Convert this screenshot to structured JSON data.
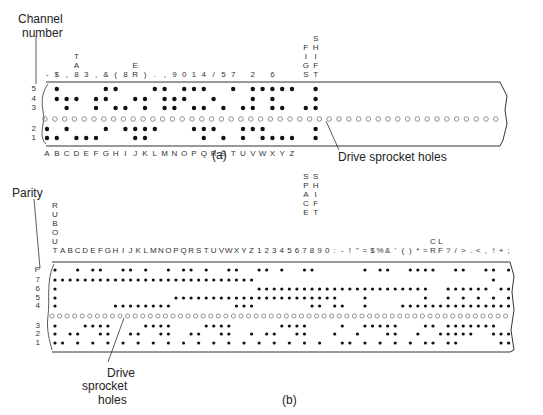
{
  "figure_a": {
    "caption": "(a)",
    "axis_label_line1": "Channel",
    "axis_label_line2": "number",
    "channels": [
      "5",
      "4",
      "3",
      "2",
      "1"
    ],
    "bottom_labels": [
      "A",
      "B",
      "C",
      "D",
      "E",
      "F",
      "G",
      "H",
      "I",
      "J",
      "K",
      "L",
      "M",
      "N",
      "O",
      "P",
      "Q",
      "R",
      "S",
      "T",
      "U",
      "V",
      "W",
      "X",
      "Y",
      "Z",
      "SPACE",
      "SHIFT"
    ],
    "top_labels": [
      "-",
      "$",
      ",",
      "8",
      "3",
      ",",
      "&",
      "(",
      "8",
      "ER",
      ")",
      ".",
      ",",
      "9",
      "0",
      "1",
      "4",
      "/",
      "5",
      "7",
      "",
      "2",
      "",
      "6",
      "",
      "",
      "FIGS",
      "SHIFT"
    ],
    "top_extra_stacked": {
      "TAB": "TAB",
      "ER": "ER"
    },
    "sprocket_label": "Drive sprocket holes",
    "codes": [
      "11000",
      "10011",
      "01110",
      "10010",
      "10000",
      "10110",
      "01011",
      "00101",
      "01100",
      "11010",
      "11110",
      "01001",
      "00111",
      "00110",
      "00011",
      "01101",
      "11101",
      "01010",
      "10100",
      "00001",
      "11100",
      "01111",
      "11001",
      "10111",
      "10101",
      "10001",
      "00100",
      "11111"
    ]
  },
  "figure_b": {
    "caption": "(b)",
    "axis_label": "Parity",
    "channels": [
      "P",
      "7",
      "6",
      "5",
      "4",
      "3",
      "2",
      "1"
    ],
    "rubout_label": "RUBOUT",
    "top_labels": [
      "T",
      "A",
      "B",
      "C",
      "D",
      "E",
      "F",
      "G",
      "H",
      "I",
      "J",
      "K",
      "L",
      "M",
      "N",
      "O",
      "P",
      "Q",
      "R",
      "S",
      "T",
      "U",
      "V",
      "W",
      "X",
      "Y",
      "Z",
      "1",
      "2",
      "3",
      "4",
      "5",
      "6",
      "7",
      "8",
      "9",
      "0",
      ":",
      "-",
      "!",
      "\"",
      "=",
      "$",
      "%",
      "&",
      "'",
      "(",
      ")",
      "*",
      "=",
      "CR",
      "LF",
      "?",
      "/",
      ">",
      ".",
      "<",
      ",",
      "↑",
      "+",
      ";"
    ],
    "sprocket_label_line1": "Drive",
    "sprocket_label_line2": "sprocket",
    "sprocket_label_line3": "holes"
  }
}
